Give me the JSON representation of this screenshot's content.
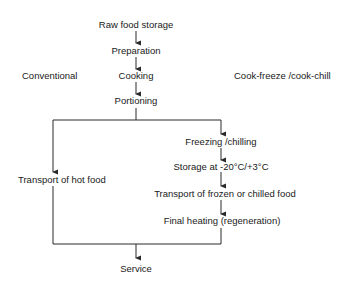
{
  "diagram": {
    "headings": {
      "left": "Conventional",
      "right": "Cook-freeze /cook-chill"
    },
    "common_steps": [
      "Raw food storage",
      "Preparation",
      "Cooking",
      "Portioning"
    ],
    "conventional_branch": [
      "Transport of hot food"
    ],
    "cook_freeze_branch": [
      "Freezing /chilling",
      "Storage at -20°C/+3°C",
      "Transport of frozen or chilled food",
      "Final heating (regeneration)"
    ],
    "final_step": "Service",
    "colors": {
      "line": "#2a2a2a",
      "text": "#1a1a1a",
      "background": "#ffffff"
    }
  }
}
